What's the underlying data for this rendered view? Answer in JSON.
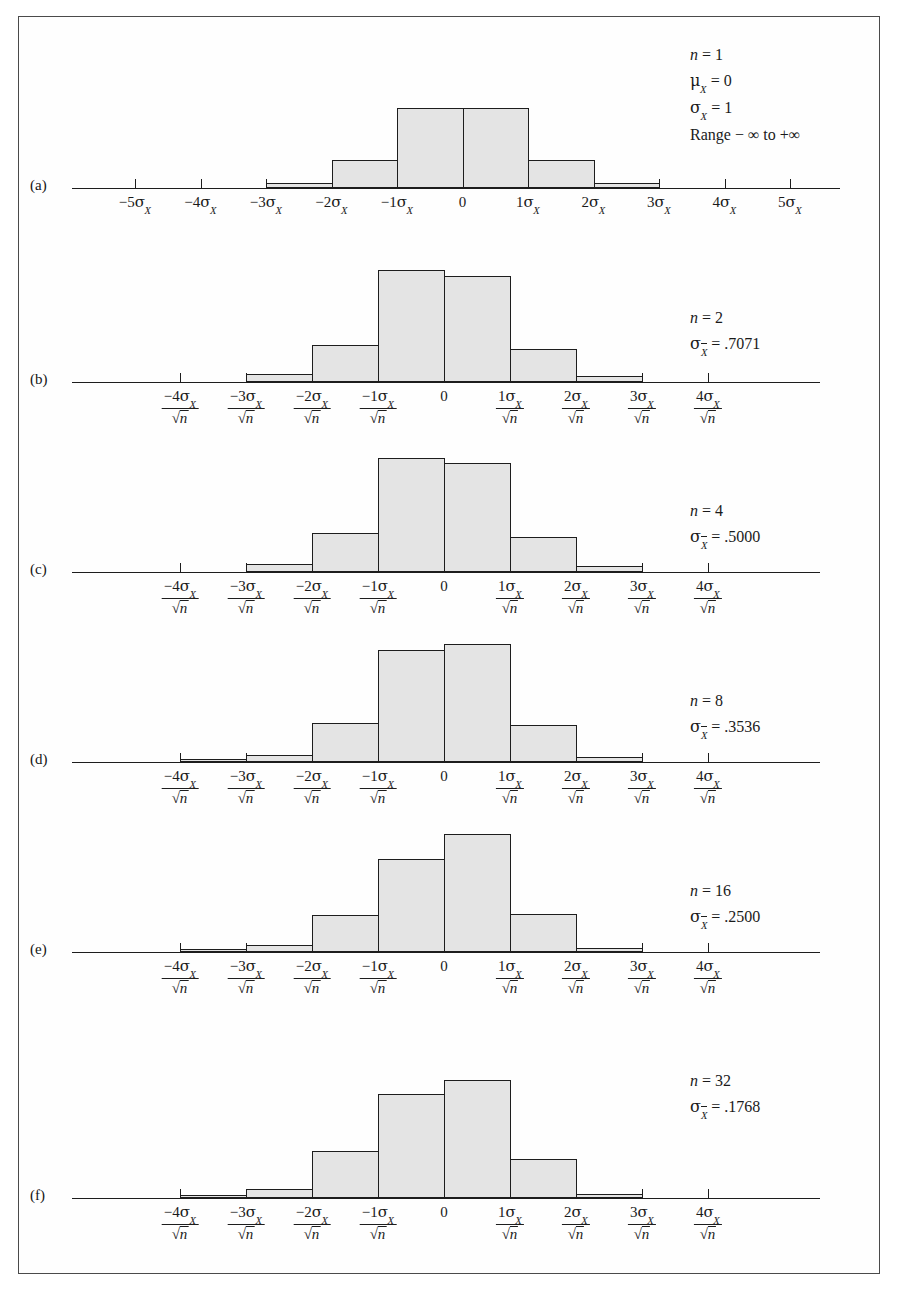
{
  "figure": {
    "background": "#ffffff",
    "frame_color": "#4a4a4a",
    "bar_fill": "#e4e4e4",
    "bar_stroke": "#1d1d1d"
  },
  "panels": [
    {
      "letter": "(a)",
      "annotation": {
        "n_label": "n",
        "n_value": "= 1",
        "mu_label": "μ",
        "mu_sub": "X",
        "mu_value": "= 0",
        "sigma_label": "σ",
        "sigma_sub": "X",
        "sigma_value": "= 1",
        "range": "Range − ∞ to +∞"
      },
      "axis_type": "plain",
      "ticks": [
        "-5",
        "-4",
        "-3",
        "-2",
        "-1",
        "0",
        "1",
        "2",
        "3",
        "4",
        "5"
      ],
      "tick_labels": [
        {
          "sign": "−5",
          "sigma": "σ",
          "sub": "X"
        },
        {
          "sign": "−4",
          "sigma": "σ",
          "sub": "X"
        },
        {
          "sign": "−3",
          "sigma": "σ",
          "sub": "X"
        },
        {
          "sign": "−2",
          "sigma": "σ",
          "sub": "X"
        },
        {
          "sign": "−1",
          "sigma": "σ",
          "sub": "X"
        },
        {
          "sign": "0",
          "sigma": "",
          "sub": ""
        },
        {
          "sign": "1",
          "sigma": "σ",
          "sub": "X"
        },
        {
          "sign": "2",
          "sigma": "σ",
          "sub": "X"
        },
        {
          "sign": "3",
          "sigma": "σ",
          "sub": "X"
        },
        {
          "sign": "4",
          "sigma": "σ",
          "sub": "X"
        },
        {
          "sign": "5",
          "sigma": "σ",
          "sub": "X"
        }
      ]
    },
    {
      "letter": "(b)",
      "annotation": {
        "n_label": "n",
        "n_value": "= 2",
        "sigma_label": "σ",
        "sigma_sub": "X",
        "sigma_value": "= .7071"
      },
      "axis_type": "fraction",
      "tick_labels": [
        {
          "sign": "−4",
          "sigma": "σ",
          "sub": "X",
          "den": "n"
        },
        {
          "sign": "−3",
          "sigma": "σ",
          "sub": "X",
          "den": "n"
        },
        {
          "sign": "−2",
          "sigma": "σ",
          "sub": "X",
          "den": "n"
        },
        {
          "sign": "−1",
          "sigma": "σ",
          "sub": "X",
          "den": "n"
        },
        {
          "sign": "0",
          "sigma": "",
          "sub": "",
          "den": ""
        },
        {
          "sign": "1",
          "sigma": "σ",
          "sub": "X",
          "den": "n"
        },
        {
          "sign": "2",
          "sigma": "σ",
          "sub": "X",
          "den": "n"
        },
        {
          "sign": "3",
          "sigma": "σ",
          "sub": "X",
          "den": "n"
        },
        {
          "sign": "4",
          "sigma": "σ",
          "sub": "X",
          "den": "n"
        }
      ]
    },
    {
      "letter": "(c)",
      "annotation": {
        "n_label": "n",
        "n_value": "= 4",
        "sigma_label": "σ",
        "sigma_sub": "X",
        "sigma_value": "= .5000"
      },
      "axis_type": "fraction",
      "tick_labels": [
        {
          "sign": "−4",
          "sigma": "σ",
          "sub": "X",
          "den": "n"
        },
        {
          "sign": "−3",
          "sigma": "σ",
          "sub": "X",
          "den": "n"
        },
        {
          "sign": "−2",
          "sigma": "σ",
          "sub": "X",
          "den": "n"
        },
        {
          "sign": "−1",
          "sigma": "σ",
          "sub": "X",
          "den": "n"
        },
        {
          "sign": "0",
          "sigma": "",
          "sub": "",
          "den": ""
        },
        {
          "sign": "1",
          "sigma": "σ",
          "sub": "X",
          "den": "n"
        },
        {
          "sign": "2",
          "sigma": "σ",
          "sub": "X",
          "den": "n"
        },
        {
          "sign": "3",
          "sigma": "σ",
          "sub": "X",
          "den": "n"
        },
        {
          "sign": "4",
          "sigma": "σ",
          "sub": "X",
          "den": "n"
        }
      ]
    },
    {
      "letter": "(d)",
      "annotation": {
        "n_label": "n",
        "n_value": "= 8",
        "sigma_label": "σ",
        "sigma_sub": "X",
        "sigma_value": "=  .3536"
      },
      "axis_type": "fraction",
      "tick_labels": [
        {
          "sign": "−4",
          "sigma": "σ",
          "sub": "X",
          "den": "n"
        },
        {
          "sign": "−3",
          "sigma": "σ",
          "sub": "X",
          "den": "n"
        },
        {
          "sign": "−2",
          "sigma": "σ",
          "sub": "X",
          "den": "n"
        },
        {
          "sign": "−1",
          "sigma": "σ",
          "sub": "X",
          "den": "n"
        },
        {
          "sign": "0",
          "sigma": "",
          "sub": "",
          "den": ""
        },
        {
          "sign": "1",
          "sigma": "σ",
          "sub": "X",
          "den": "n"
        },
        {
          "sign": "2",
          "sigma": "σ",
          "sub": "X",
          "den": "n"
        },
        {
          "sign": "3",
          "sigma": "σ",
          "sub": "X",
          "den": "n"
        },
        {
          "sign": "4",
          "sigma": "σ",
          "sub": "X",
          "den": "n"
        }
      ]
    },
    {
      "letter": "(e)",
      "annotation": {
        "n_label": "n",
        "n_value": "= 16",
        "sigma_label": "σ",
        "sigma_sub": "X",
        "sigma_value": "= .2500"
      },
      "axis_type": "fraction",
      "tick_labels": [
        {
          "sign": "−4",
          "sigma": "σ",
          "sub": "X",
          "den": "n"
        },
        {
          "sign": "−3",
          "sigma": "σ",
          "sub": "X",
          "den": "n"
        },
        {
          "sign": "−2",
          "sigma": "σ",
          "sub": "X",
          "den": "n"
        },
        {
          "sign": "−1",
          "sigma": "σ",
          "sub": "X",
          "den": "n"
        },
        {
          "sign": "0",
          "sigma": "",
          "sub": "",
          "den": ""
        },
        {
          "sign": "1",
          "sigma": "σ",
          "sub": "X",
          "den": "n"
        },
        {
          "sign": "2",
          "sigma": "σ",
          "sub": "X",
          "den": "n"
        },
        {
          "sign": "3",
          "sigma": "σ",
          "sub": "X",
          "den": "n"
        },
        {
          "sign": "4",
          "sigma": "σ",
          "sub": "X",
          "den": "n"
        }
      ]
    },
    {
      "letter": "(f)",
      "annotation": {
        "n_label": "n",
        "n_value": "= 32",
        "sigma_label": "σ",
        "sigma_sub": "X",
        "sigma_value": "= .1768"
      },
      "axis_type": "fraction",
      "tick_labels": [
        {
          "sign": "−4",
          "sigma": "σ",
          "sub": "X",
          "den": "n"
        },
        {
          "sign": "−3",
          "sigma": "σ",
          "sub": "X",
          "den": "n"
        },
        {
          "sign": "−2",
          "sigma": "σ",
          "sub": "X",
          "den": "n"
        },
        {
          "sign": "−1",
          "sigma": "σ",
          "sub": "X",
          "den": "n"
        },
        {
          "sign": "0",
          "sigma": "",
          "sub": "",
          "den": ""
        },
        {
          "sign": "1",
          "sigma": "σ",
          "sub": "X",
          "den": "n"
        },
        {
          "sign": "2",
          "sigma": "σ",
          "sub": "X",
          "den": "n"
        },
        {
          "sign": "3",
          "sigma": "σ",
          "sub": "X",
          "den": "n"
        },
        {
          "sign": "4",
          "sigma": "σ",
          "sub": "X",
          "den": "n"
        }
      ]
    }
  ],
  "chart_data": {
    "type": "bar",
    "xlabel": "Standard error units",
    "ylabel": "Relative frequency",
    "grid": false,
    "legend": "none",
    "note": "Six stacked histogram panels (a)-(f); each panel's bars are one standard-error wide and centered on 0.",
    "panels": [
      {
        "letter": "(a)",
        "n": 1,
        "mu_X": 0,
        "sigma_X": 1,
        "range": "-inf to +inf",
        "axis_min": -5,
        "axis_max": 5,
        "bar_left_edges": [
          -3,
          -2,
          -1,
          0,
          1,
          2
        ],
        "bar_width": 1,
        "values": [
          0.05,
          0.26,
          0.74,
          0.74,
          0.26,
          0.05
        ]
      },
      {
        "letter": "(b)",
        "n": 2,
        "sigma_xbar": 0.7071,
        "axis_min": -4,
        "axis_max": 4,
        "bar_left_edges": [
          -3,
          -2,
          -1,
          0,
          1,
          2
        ],
        "bar_width": 1,
        "values": [
          0.07,
          0.31,
          0.95,
          0.9,
          0.28,
          0.05
        ]
      },
      {
        "letter": "(c)",
        "n": 4,
        "sigma_xbar": 0.5,
        "axis_min": -4,
        "axis_max": 4,
        "bar_left_edges": [
          -3,
          -2,
          -1,
          0,
          1,
          2
        ],
        "bar_width": 1,
        "values": [
          0.07,
          0.33,
          0.97,
          0.92,
          0.3,
          0.05
        ]
      },
      {
        "letter": "(d)",
        "n": 8,
        "sigma_xbar": 0.3536,
        "axis_min": -4,
        "axis_max": 4,
        "bar_left_edges": [
          -4,
          -3,
          -2,
          -1,
          0,
          1,
          2
        ],
        "bar_width": 1,
        "values": [
          0.02,
          0.06,
          0.33,
          0.95,
          1.0,
          0.31,
          0.04
        ]
      },
      {
        "letter": "(e)",
        "n": 16,
        "sigma_xbar": 0.25,
        "axis_min": -4,
        "axis_max": 4,
        "bar_left_edges": [
          -4,
          -3,
          -2,
          -1,
          0,
          1,
          2
        ],
        "bar_width": 1,
        "values": [
          0.02,
          0.06,
          0.31,
          0.79,
          1.0,
          0.32,
          0.03
        ]
      },
      {
        "letter": "(f)",
        "n": 32,
        "sigma_xbar": 0.1768,
        "axis_min": -4,
        "axis_max": 4,
        "bar_left_edges": [
          -4,
          -3,
          -2,
          -1,
          0,
          1,
          2
        ],
        "bar_width": 1,
        "values": [
          0.02,
          0.08,
          0.4,
          0.88,
          1.0,
          0.33,
          0.03
        ]
      }
    ]
  }
}
